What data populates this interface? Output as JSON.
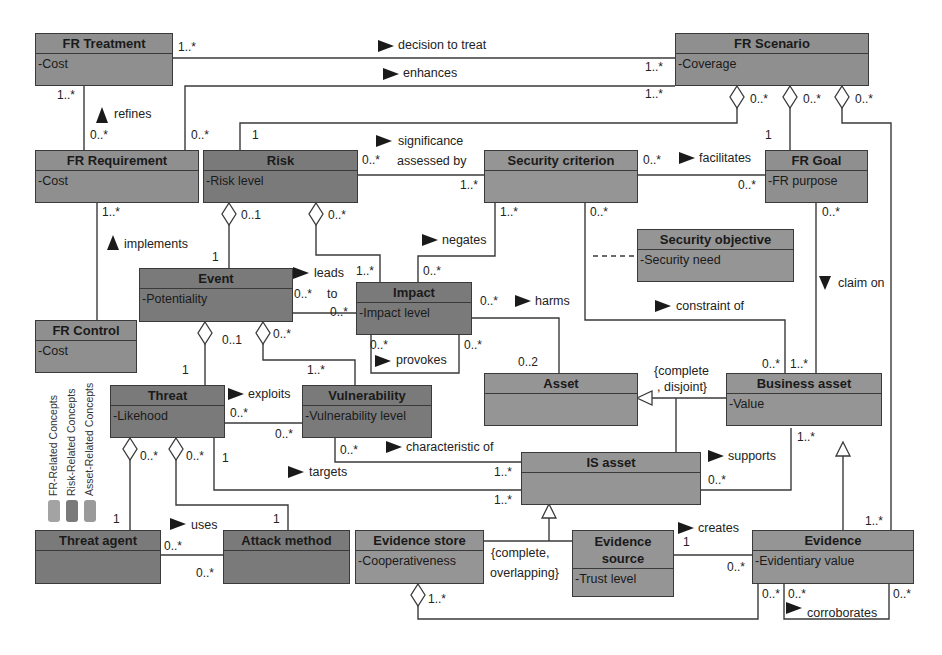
{
  "colors": {
    "fr": "#8f8f8f",
    "risk": "#7a7a7a",
    "asset": "#959595",
    "line": "#3a3a3a"
  },
  "classes": {
    "fr_treatment": {
      "name": "FR Treatment",
      "attr": "-Cost"
    },
    "fr_scenario": {
      "name": "FR Scenario",
      "attr": "-Coverage"
    },
    "fr_requirement": {
      "name": "FR Requirement",
      "attr": "-Cost"
    },
    "risk": {
      "name": "Risk",
      "attr": "-Risk level"
    },
    "security_criterion": {
      "name": "Security criterion",
      "attr": ""
    },
    "fr_goal": {
      "name": "FR Goal",
      "attr": "-FR purpose"
    },
    "security_objective": {
      "name": "Security objective",
      "attr": "-Security need"
    },
    "event": {
      "name": "Event",
      "attr": "-Potentiality"
    },
    "impact": {
      "name": "Impact",
      "attr": "-Impact level"
    },
    "fr_control": {
      "name": "FR Control",
      "attr": "-Cost"
    },
    "threat": {
      "name": "Threat",
      "attr": "-Likehood"
    },
    "vulnerability": {
      "name": "Vulnerability",
      "attr": "-Vulnerability level"
    },
    "asset": {
      "name": "Asset",
      "attr": ""
    },
    "business_asset": {
      "name": "Business asset",
      "attr": "-Value"
    },
    "is_asset": {
      "name": "IS asset",
      "attr": ""
    },
    "threat_agent": {
      "name": "Threat agent",
      "attr": ""
    },
    "attack_method": {
      "name": "Attack method",
      "attr": ""
    },
    "evidence_store": {
      "name": "Evidence store",
      "attr": "-Cooperativeness"
    },
    "evidence_source": {
      "name": "Evidence source",
      "attr": "-Trust level"
    },
    "evidence": {
      "name": "Evidence",
      "attr": "-Evidentiary value"
    }
  },
  "associations": {
    "decision_to_treat": "decision to treat",
    "enhances": "enhances",
    "refines": "refines",
    "significance": "significance",
    "assessed_by": "assessed by",
    "facilitates": "facilitates",
    "implements": "implements",
    "negates": "negates",
    "leads": "leads",
    "to": "to",
    "harms": "harms",
    "provokes": "provokes",
    "constraint_of": "constraint of",
    "claim_on": "claim on",
    "exploits": "exploits",
    "characteristic_of": "characteristic of",
    "targets": "targets",
    "supports": "supports",
    "uses": "uses",
    "creates": "creates",
    "corroborates": "corroborates"
  },
  "constraints": {
    "asset_gen_1": "{complete",
    "asset_gen_2": ", disjoint}",
    "is_gen_1": "{complete,",
    "is_gen_2": "overlapping}"
  },
  "multiplicities": {
    "m1": "1..*",
    "m2": "1..*",
    "m3": "1..*",
    "m4": "1..*",
    "m5": "0..*",
    "m6": "0..*",
    "m7": "0..*",
    "m8": "0..*",
    "m9": "0..*",
    "m10": "1",
    "m11": "1",
    "m12": "0..*",
    "m13": "1..*",
    "m14": "0..*",
    "m15": "0..*",
    "m16": "1..*",
    "m17": "0..1",
    "m18": "0..*",
    "m19": "1..*",
    "m20": "0..*",
    "m21": "1",
    "m22": "1..*",
    "m23": "0..*",
    "m24": "0..*",
    "m25": "0..*",
    "m26": "0..*",
    "m27": "0..*",
    "m28": "0..2",
    "m29": "0..1",
    "m30": "0..*",
    "m31": "1",
    "m32": "1..*",
    "m33": "0..*",
    "m34": "0..*",
    "m35": "0..*",
    "m36": "0..*",
    "m37": "0..*",
    "m38": "0..*",
    "m39": "1..*",
    "m40": "1..*",
    "m41": "1..*",
    "m42": "0..*",
    "m43": "1..*",
    "m44": "1",
    "m45": "0..*",
    "m46": "0..*",
    "m47": "1",
    "m48": "1",
    "m49": "1..*",
    "m50": "1",
    "m51": "0..*",
    "m52": "1..*",
    "m53": "0..*",
    "m54": "0..*",
    "m55": "0..*",
    "m56": "0..*"
  },
  "legend": {
    "items": [
      {
        "label": "FR-Related Concepts",
        "color": "#a3a3a3"
      },
      {
        "label": "Risk-Related Concepts",
        "color": "#7a7a7a"
      },
      {
        "label": "Asset-Related Concepts",
        "color": "#9a9a9a"
      }
    ]
  }
}
